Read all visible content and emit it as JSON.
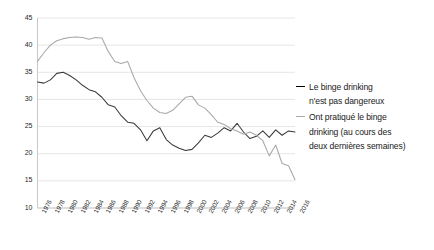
{
  "chart_data": {
    "type": "line",
    "title": "",
    "subtitle": "",
    "xlabel": "",
    "ylabel": "",
    "ylim": [
      10,
      45
    ],
    "ytick_values": [
      10,
      15,
      20,
      25,
      30,
      35,
      40,
      45
    ],
    "ytick_labels": [
      "10",
      "15",
      "20",
      "25",
      "30",
      "35",
      "40",
      "45"
    ],
    "grid": true,
    "grid_axis": "y",
    "legend_position": "right",
    "x": [
      1976,
      1977,
      1978,
      1979,
      1980,
      1981,
      1982,
      1983,
      1984,
      1985,
      1986,
      1987,
      1988,
      1989,
      1990,
      1991,
      1992,
      1993,
      1994,
      1995,
      1996,
      1997,
      1998,
      1999,
      2000,
      2001,
      2002,
      2003,
      2004,
      2005,
      2006,
      2007,
      2008,
      2009,
      2010,
      2011,
      2012,
      2013,
      2014,
      2015,
      2016
    ],
    "xtick_labels": [
      "1976",
      "1978",
      "1980",
      "1982",
      "1984",
      "1986",
      "1988",
      "1990",
      "1992",
      "1994",
      "1996",
      "1998",
      "2000",
      "2002",
      "2004",
      "2006",
      "2008",
      "2010",
      "2012",
      "2014",
      "2016"
    ],
    "xtick_step": 2,
    "series": [
      {
        "name": "Le binge drinking n'est pas dangereux",
        "color": "#3a3a3a",
        "values": [
          33.2,
          33.0,
          33.6,
          34.8,
          35.0,
          34.4,
          33.6,
          32.6,
          31.8,
          31.4,
          30.4,
          29.0,
          28.6,
          27.0,
          25.8,
          25.6,
          24.4,
          22.4,
          24.2,
          24.8,
          22.6,
          21.6,
          21.0,
          20.6,
          20.8,
          22.0,
          23.4,
          23.0,
          23.8,
          24.8,
          24.2,
          25.6,
          24.0,
          22.8,
          23.2,
          24.2,
          23.0,
          24.4,
          23.4,
          24.2,
          24.0
        ]
      },
      {
        "name": "Ont pratiqué le binge drinking (au cours des deux dernières semaines)",
        "color": "#a8a8a8",
        "values": [
          37.0,
          38.6,
          40.0,
          40.8,
          41.2,
          41.4,
          41.5,
          41.4,
          41.1,
          41.4,
          41.3,
          38.8,
          37.0,
          36.6,
          37.0,
          34.0,
          31.6,
          29.8,
          28.4,
          27.6,
          27.4,
          28.0,
          29.2,
          30.4,
          30.6,
          29.0,
          28.4,
          27.2,
          25.8,
          25.4,
          24.6,
          24.2,
          23.6,
          24.0,
          23.4,
          22.4,
          19.6,
          21.6,
          18.2,
          17.8,
          15.2
        ]
      }
    ]
  },
  "legend": {
    "entries": [
      {
        "label_line1": "Le binge drinking",
        "label_line2": "n'est pas dangereux"
      },
      {
        "label_line1": "Ont pratiqué le binge",
        "label_line2": "drinking (au cours des",
        "label_line3": "deux dernières semaines)"
      }
    ]
  },
  "colors": {
    "series_dark": "#3a3a3a",
    "series_light": "#a8a8a8",
    "gridline": "#e6e6e6",
    "axis": "#c9c9c9",
    "text": "#2b2b2b",
    "background": "#ffffff"
  }
}
